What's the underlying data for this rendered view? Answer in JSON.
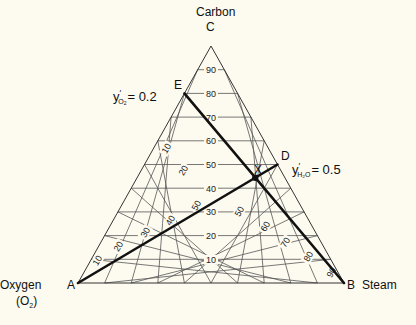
{
  "chart_data": {
    "type": "ternary",
    "title": "",
    "components": {
      "top": {
        "name": "Carbon",
        "vertex": "C"
      },
      "left": {
        "name": "Oxygen",
        "formula": "(O2)",
        "vertex": "A"
      },
      "right": {
        "name": "Steam",
        "vertex": "B"
      }
    },
    "grid_divisions": 10,
    "carbon_ticks": [
      "10",
      "20",
      "30",
      "40",
      "50",
      "60",
      "70",
      "80",
      "90"
    ],
    "steam_ticks": [
      "50",
      "60",
      "70",
      "80",
      "90"
    ],
    "oxygen_ticks_shown": [
      "10",
      "20"
    ],
    "ad_line_ticks": [
      "10",
      "20",
      "30",
      "40",
      "50"
    ],
    "points": {
      "A": {
        "label": "A",
        "carbon": 0,
        "oxygen": 1.0,
        "steam": 0
      },
      "B": {
        "label": "B",
        "carbon": 0,
        "oxygen": 0,
        "steam": 1.0
      },
      "C": {
        "label": "C",
        "carbon": 1.0,
        "oxygen": 0,
        "steam": 0
      },
      "D": {
        "label": "D",
        "carbon": 0.5,
        "oxygen": 0,
        "steam": 0.5
      },
      "E": {
        "label": "E",
        "carbon": 0.8,
        "oxygen": 0.2,
        "steam": 0
      },
      "X": {
        "label": "X",
        "note": "intersection of AD and EB"
      }
    },
    "lines": [
      {
        "from": "A",
        "to": "D",
        "label": "y'H2O = 0.5"
      },
      {
        "from": "E",
        "to": "B",
        "label": "y'O2 = 0.2"
      }
    ],
    "annotations": [
      {
        "text": "y'O2 = 0.2",
        "near": "E"
      },
      {
        "text": "y'H2O = 0.5",
        "near": "D"
      }
    ]
  },
  "labels": {
    "carbon": "Carbon",
    "c": "C",
    "oxygen": "Oxygen",
    "oxygen_formula_o": "(O",
    "oxygen_formula_sub": "2",
    "oxygen_formula_close": ")",
    "a": "A",
    "b": "B",
    "steam": "Steam",
    "d": "D",
    "e": "E",
    "x": "X",
    "eq_e_y": "y",
    "eq_e_sub": "O",
    "eq_e_subsub": "2",
    "eq_e_val": "= 0.2",
    "eq_d_y": "y",
    "eq_d_sub": "H₂O",
    "eq_d_val": "= 0.5",
    "prime": "′"
  }
}
